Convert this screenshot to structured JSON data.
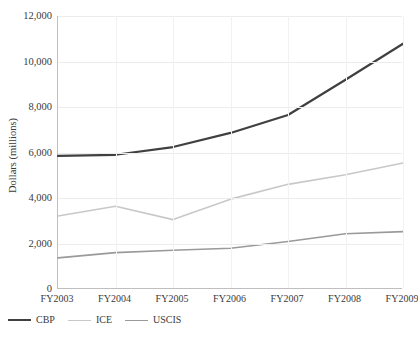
{
  "chart_data": {
    "type": "line",
    "title": "",
    "xlabel": "",
    "ylabel": "Dollars (millions)",
    "categories": [
      "FY2003",
      "FY2004",
      "FY2005",
      "FY2006",
      "FY2007",
      "FY2008",
      "FY2009"
    ],
    "ylim": [
      0,
      12000
    ],
    "ytick_values": [
      0,
      2000,
      4000,
      6000,
      8000,
      10000,
      12000
    ],
    "ytick_labels": [
      "0",
      "2,000",
      "4,000",
      "6,000",
      "8,000",
      "10,000",
      "12,000"
    ],
    "grid": true,
    "legend_position": "bottom-left",
    "series": [
      {
        "name": "CBP",
        "color": "#404040",
        "width": 2.2,
        "values": [
          5850,
          5900,
          6240,
          6860,
          7650,
          9200,
          10780
        ]
      },
      {
        "name": "ICE",
        "color": "#c8c8c8",
        "width": 1.6,
        "values": [
          3210,
          3640,
          3050,
          3950,
          4600,
          5020,
          5540
        ]
      },
      {
        "name": "USCIS",
        "color": "#9a9a9a",
        "width": 1.6,
        "values": [
          1370,
          1600,
          1700,
          1790,
          2090,
          2430,
          2520
        ]
      }
    ]
  },
  "legend": {
    "items": [
      {
        "label": "CBP"
      },
      {
        "label": "ICE"
      },
      {
        "label": "USCIS"
      }
    ]
  },
  "footer": {
    "source_note": ""
  }
}
